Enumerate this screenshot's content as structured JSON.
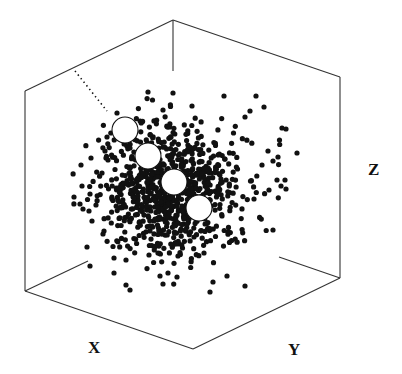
{
  "chart_data": {
    "type": "scatter",
    "projection": "3d-isometric",
    "title": "",
    "axes": {
      "x_label": "X",
      "y_label": "Y",
      "z_label": "Z"
    },
    "grid": false,
    "legend": null,
    "box": {
      "top": [
        173,
        20
      ],
      "top_inner_end": [
        173,
        71
      ],
      "top_left": [
        25,
        91
      ],
      "bottom_left": [
        25,
        291
      ],
      "top_right": [
        340,
        77
      ],
      "bottom_right": [
        340,
        278
      ],
      "bottom_front": [
        193,
        349
      ],
      "inner_left_stub_end": [
        88,
        261
      ],
      "inner_right_stub_end": [
        279,
        257
      ]
    },
    "cluster": {
      "description": "dense point cloud (~1000 small black points) centered in the cube",
      "center": [
        172,
        188
      ],
      "spread_x": 46,
      "spread_y": 42,
      "count": 900,
      "point_radius": 2.6,
      "seed": 7
    },
    "outliers": [
      [
        148,
        92
      ],
      [
        173,
        93
      ],
      [
        192,
        106
      ],
      [
        163,
        110
      ],
      [
        224,
        96
      ],
      [
        256,
        96
      ],
      [
        245,
        117
      ],
      [
        250,
        111
      ],
      [
        264,
        107
      ],
      [
        282,
        128
      ],
      [
        286,
        129
      ],
      [
        268,
        151
      ],
      [
        278,
        157
      ],
      [
        297,
        153
      ],
      [
        262,
        165
      ],
      [
        273,
        161
      ],
      [
        277,
        180
      ],
      [
        281,
        186
      ],
      [
        286,
        189
      ],
      [
        254,
        199
      ],
      [
        269,
        190
      ],
      [
        285,
        180
      ],
      [
        273,
        230
      ],
      [
        204,
        253
      ],
      [
        228,
        232
      ],
      [
        211,
        229
      ],
      [
        194,
        237
      ],
      [
        181,
        229
      ],
      [
        178,
        256
      ],
      [
        213,
        282
      ],
      [
        210,
        292
      ],
      [
        227,
        276
      ],
      [
        245,
        286
      ],
      [
        163,
        284
      ],
      [
        160,
        276
      ],
      [
        130,
        290
      ],
      [
        114,
        273
      ],
      [
        126,
        260
      ],
      [
        114,
        258
      ],
      [
        103,
        234
      ],
      [
        104,
        231
      ],
      [
        89,
        211
      ],
      [
        96,
        205
      ],
      [
        83,
        209
      ],
      [
        92,
        221
      ],
      [
        80,
        204
      ],
      [
        90,
        194
      ],
      [
        82,
        186
      ],
      [
        81,
        165
      ],
      [
        91,
        158
      ],
      [
        106,
        158
      ],
      [
        102,
        173
      ],
      [
        90,
        266
      ],
      [
        126,
        285
      ],
      [
        158,
        253
      ],
      [
        168,
        273
      ],
      [
        149,
        255
      ],
      [
        177,
        277
      ],
      [
        127,
        217
      ],
      [
        87,
        247
      ],
      [
        74,
        197
      ],
      [
        107,
        137
      ],
      [
        130,
        148
      ],
      [
        105,
        151
      ],
      [
        108,
        160
      ],
      [
        117,
        113
      ]
    ],
    "highlighted_points": [
      {
        "cx": 125,
        "cy": 130,
        "r": 13
      },
      {
        "cx": 148,
        "cy": 156,
        "r": 13
      },
      {
        "cx": 174,
        "cy": 182,
        "r": 13
      },
      {
        "cx": 199,
        "cy": 208,
        "r": 13
      }
    ],
    "dotted_trail": {
      "from": [
        75,
        71
      ],
      "to": [
        107,
        111
      ]
    }
  },
  "labels": {
    "x": "X",
    "y": "Y",
    "z": "Z"
  }
}
